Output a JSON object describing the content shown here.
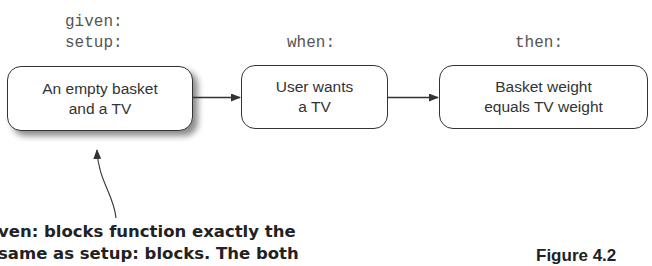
{
  "labels": {
    "given": "given:",
    "setup": "setup:",
    "when": "when:",
    "then": "then:"
  },
  "boxes": [
    {
      "line1": "An empty basket",
      "line2": "and a TV"
    },
    {
      "line1": "User wants",
      "line2": "a TV"
    },
    {
      "line1": "Basket weight",
      "line2": "equals TV weight"
    }
  ],
  "callout": {
    "line1": "ven: blocks function exactly the",
    "line2": "same as setup: blocks. The both"
  },
  "figure": {
    "label": "Figure 4.2"
  },
  "colors": {
    "stroke": "#333333",
    "text": "#333333",
    "label": "#555555"
  }
}
